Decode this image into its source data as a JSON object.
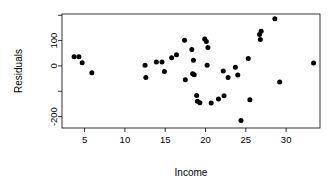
{
  "chart_data": {
    "type": "scatter",
    "title": "",
    "xlabel": "Income",
    "ylabel": "Residuals",
    "xlim": [
      2.2,
      34.2
    ],
    "ylim": [
      -245,
      205
    ],
    "grid": false,
    "legend": null,
    "x_ticks": [
      5,
      10,
      15,
      20,
      25,
      30
    ],
    "x_tick_labels": [
      "5",
      "10",
      "15",
      "20",
      "25",
      "30"
    ],
    "y_ticks": [
      -200,
      -100,
      0,
      100,
      200
    ],
    "y_tick_labels": [
      "-200",
      "",
      "0",
      "100",
      ""
    ],
    "marker": "filled-circle",
    "marker_color": "#000000",
    "points": [
      {
        "x": 3.7,
        "y": 36
      },
      {
        "x": 4.3,
        "y": 36
      },
      {
        "x": 4.7,
        "y": 13
      },
      {
        "x": 5.9,
        "y": -27
      },
      {
        "x": 12.5,
        "y": 3
      },
      {
        "x": 12.6,
        "y": -46
      },
      {
        "x": 13.9,
        "y": 16
      },
      {
        "x": 14.6,
        "y": 16
      },
      {
        "x": 14.9,
        "y": -22
      },
      {
        "x": 15.8,
        "y": 32
      },
      {
        "x": 16.4,
        "y": 44
      },
      {
        "x": 17.4,
        "y": 101
      },
      {
        "x": 17.5,
        "y": -55
      },
      {
        "x": 18.3,
        "y": 65
      },
      {
        "x": 18.4,
        "y": -31
      },
      {
        "x": 18.6,
        "y": -35
      },
      {
        "x": 18.5,
        "y": 22
      },
      {
        "x": 18.9,
        "y": -117
      },
      {
        "x": 19.0,
        "y": -139
      },
      {
        "x": 19.3,
        "y": -145
      },
      {
        "x": 19.9,
        "y": 106
      },
      {
        "x": 20.1,
        "y": 96
      },
      {
        "x": 20.3,
        "y": 73
      },
      {
        "x": 20.2,
        "y": 3
      },
      {
        "x": 20.7,
        "y": -146
      },
      {
        "x": 21.6,
        "y": -131
      },
      {
        "x": 22.2,
        "y": -20
      },
      {
        "x": 22.3,
        "y": -118
      },
      {
        "x": 22.8,
        "y": -46
      },
      {
        "x": 23.7,
        "y": -5
      },
      {
        "x": 24.0,
        "y": -36
      },
      {
        "x": 24.4,
        "y": -215
      },
      {
        "x": 25.3,
        "y": 29
      },
      {
        "x": 25.5,
        "y": -133
      },
      {
        "x": 26.7,
        "y": 124
      },
      {
        "x": 26.9,
        "y": 137
      },
      {
        "x": 26.8,
        "y": 104
      },
      {
        "x": 28.6,
        "y": 186
      },
      {
        "x": 29.2,
        "y": -63
      },
      {
        "x": 33.4,
        "y": 12
      }
    ]
  },
  "axis": {
    "y_label": "Residuals",
    "x_label": "Income"
  }
}
